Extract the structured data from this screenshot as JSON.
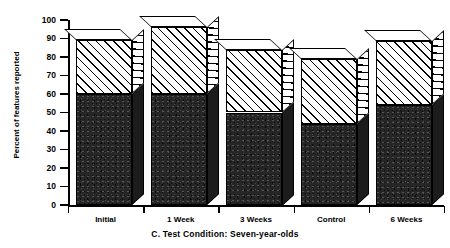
{
  "chart_data": {
    "type": "bar",
    "subtype": "stacked-3d-column",
    "title": "",
    "caption": "C.  Test Condition:  Seven-year-olds",
    "xlabel": "",
    "ylabel": "Percent of features reported",
    "categories": [
      "Initial",
      "1 Week",
      "3 Weeks",
      "Control",
      "6 Weeks"
    ],
    "ylim": [
      0,
      100
    ],
    "ytick_labels": [
      "100",
      "90",
      "80",
      "70",
      "60",
      "50",
      "40",
      "30",
      "20",
      "10",
      "0"
    ],
    "ytick_values": [
      100,
      90,
      80,
      70,
      60,
      50,
      40,
      30,
      20,
      10,
      0
    ],
    "ytick_step": 10,
    "grid": false,
    "legend": "none",
    "series": [
      {
        "name": "lower-dark-segment",
        "fill": "dark-stipple",
        "values": [
          60,
          60,
          50,
          44,
          54
        ]
      },
      {
        "name": "upper-hatched-segment",
        "fill": "diagonal-hatch",
        "values": [
          29,
          36,
          34,
          35,
          34.5
        ]
      }
    ],
    "totals": [
      89,
      96,
      84,
      79,
      88.5
    ],
    "colors": {
      "axis": "#000000",
      "hatch": "#000000",
      "hatch_background": "#ffffff",
      "dark_fill": "#262626",
      "page_background": "#ffffff"
    }
  }
}
